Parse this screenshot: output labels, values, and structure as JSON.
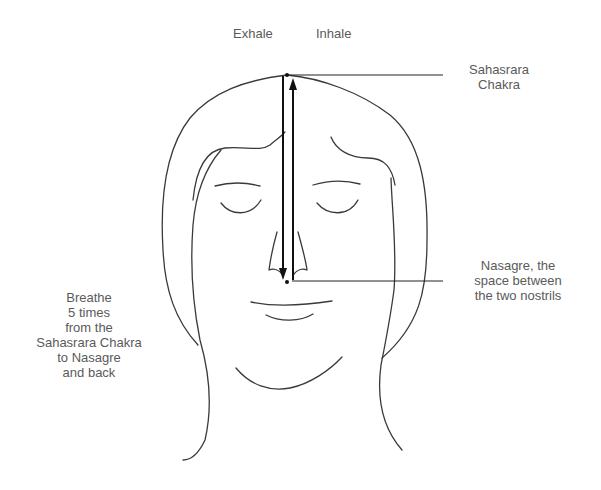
{
  "labels": {
    "exhale": "Exhale",
    "inhale": "Inhale",
    "sahasrara": [
      "Sahasrara",
      "Chakra"
    ],
    "nasagre": [
      "Nasagre, the",
      "space between",
      "the two nostrils"
    ],
    "instruction": [
      "Breathe",
      "5 times",
      "from the",
      "Sahasrara Chakra",
      "to Nasagre",
      "and back"
    ]
  },
  "colors": {
    "text": "#5a5a5a",
    "line": "#3a3a3a",
    "arrow": "#111111",
    "background": "#ffffff"
  },
  "points": {
    "sahasrara": {
      "x": 287,
      "y": 75
    },
    "nasagre": {
      "x": 287,
      "y": 281
    }
  },
  "arrows": [
    {
      "name": "exhale",
      "direction": "down",
      "x": 283,
      "from_y": 75,
      "to_y": 281
    },
    {
      "name": "inhale",
      "direction": "up",
      "x": 293,
      "from_y": 281,
      "to_y": 77
    }
  ]
}
